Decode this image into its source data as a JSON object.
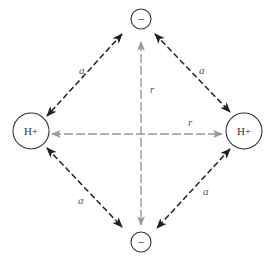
{
  "diagram": {
    "title": "",
    "colors": {
      "ion_stroke": "#333333",
      "attraction_arrow": "#222222",
      "repulsion_arrow": "#999999",
      "background": "#ffffff"
    },
    "nodes": [
      {
        "id": "anion-top",
        "label": "−",
        "type": "anion",
        "cx": 141,
        "cy": 19,
        "r": 10
      },
      {
        "id": "cation-left",
        "label": "H+",
        "type": "cation",
        "cx": 31,
        "cy": 131,
        "r": 18
      },
      {
        "id": "cation-right",
        "label": "H+",
        "type": "cation",
        "cx": 244,
        "cy": 131,
        "r": 18
      },
      {
        "id": "anion-bottom",
        "label": "−",
        "type": "anion",
        "cx": 141,
        "cy": 242,
        "r": 10
      }
    ],
    "edges": [
      {
        "from": "anion-top",
        "to": "cation-left",
        "label": "a",
        "kind": "attraction"
      },
      {
        "from": "anion-top",
        "to": "cation-right",
        "label": "a",
        "kind": "attraction"
      },
      {
        "from": "cation-left",
        "to": "anion-bottom",
        "label": "a",
        "kind": "attraction"
      },
      {
        "from": "cation-right",
        "to": "anion-bottom",
        "label": "a",
        "kind": "attraction"
      },
      {
        "from": "anion-top",
        "to": "anion-bottom",
        "label": "r",
        "kind": "repulsion"
      },
      {
        "from": "cation-left",
        "to": "cation-right",
        "label": "r",
        "kind": "repulsion"
      }
    ],
    "labels": {
      "top_ion": "−",
      "bottom_ion": "−",
      "left_ion": "H+",
      "right_ion": "H+",
      "a_top_left": "a",
      "a_top_right": "a",
      "a_bottom_left": "a",
      "a_bottom_right": "a",
      "r_vertical": "r",
      "r_horizontal": "r"
    }
  }
}
